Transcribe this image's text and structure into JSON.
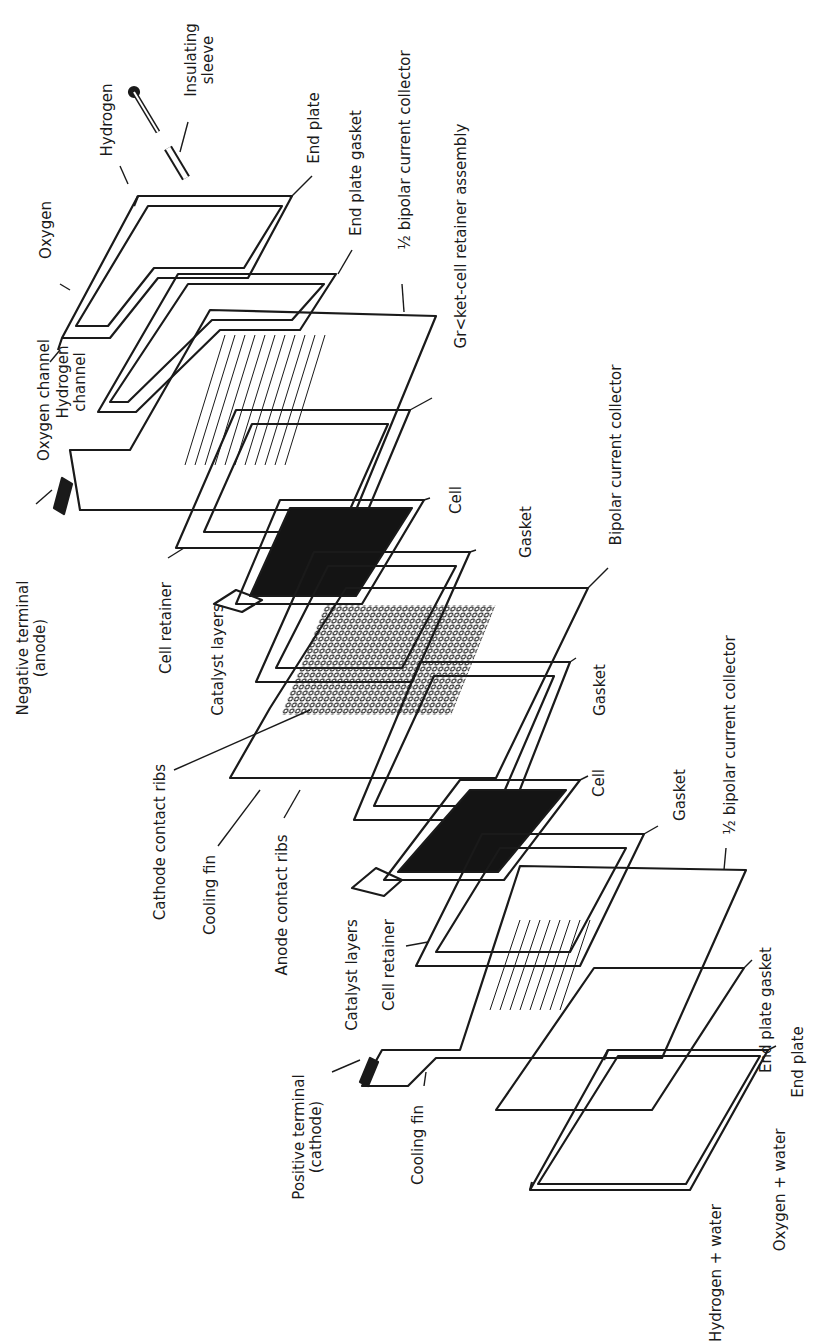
{
  "diagram": {
    "type": "exploded-assembly",
    "orientation": "rotated 90 degrees counter-clockwise",
    "colors": {
      "ink": "#1a1a1a",
      "paper": "#ffffff",
      "fill_dark": "#141414"
    },
    "labels": {
      "hydrogen": "Hydrogen",
      "insulating_sleeve_1": "Insulating",
      "insulating_sleeve_2": "sleeve",
      "oxygen": "Oxygen",
      "end_plate_top": "End plate",
      "end_plate_gasket_top": "End plate gasket",
      "half_bipolar_top": "½ bipolar current collector",
      "gasket_cell_retainer_assembly": "Gr<ket-cell retainer assembly",
      "oxygen_channel": "Oxygen channel",
      "hydrogen_channel_1": "Hydrogen",
      "hydrogen_channel_2": "channel",
      "negative_terminal_1": "Negative terminal",
      "negative_terminal_2": "(anode)",
      "cell_retainer_top": "Cell retainer",
      "cell_top": "Cell",
      "gasket_1": "Gasket",
      "bipolar_current_collector": "Bipolar current collector",
      "catalyst_layers_top": "Catalyst layers",
      "cathode_contact_ribs": "Cathode contact ribs",
      "cooling_fin_top": "Cooling fin",
      "anode_contact_ribs": "Anode contact ribs",
      "gasket_2": "Gasket",
      "cell_bottom": "Cell",
      "gasket_3": "Gasket",
      "half_bipolar_bottom": "½ bipolar current collector",
      "catalyst_layers_bottom": "Catalyst layers",
      "cell_retainer_bottom": "Cell retainer",
      "positive_terminal_1": "Positive terminal",
      "positive_terminal_2": "(cathode)",
      "cooling_fin_bottom": "Cooling fin",
      "end_plate_gasket_bottom": "End plate gasket",
      "end_plate_bottom": "End plate",
      "oxygen_water": "Oxygen + water",
      "hydrogen_water": "Hydrogen + water"
    }
  }
}
